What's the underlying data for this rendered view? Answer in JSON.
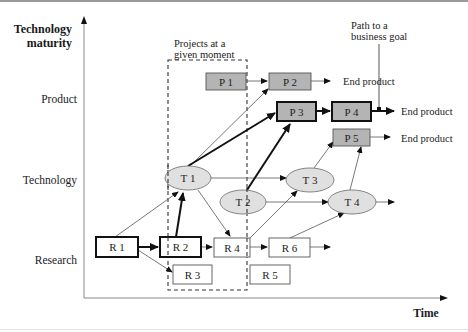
{
  "axes": {
    "y_title_line1": "Technology",
    "y_title_line2": "maturity",
    "x_title": "Time",
    "levels": [
      {
        "label": "Product"
      },
      {
        "label": "Technology"
      },
      {
        "label": "Research"
      }
    ]
  },
  "annotations": {
    "window_line1": "Projects at a",
    "window_line2": "given moment",
    "goal_line1": "Path to a",
    "goal_line2": "business goal"
  },
  "products": [
    {
      "id": "P1",
      "label": "P 1",
      "highlighted": false
    },
    {
      "id": "P2",
      "label": "P 2",
      "highlighted": false
    },
    {
      "id": "P3",
      "label": "P 3",
      "highlighted": true
    },
    {
      "id": "P4",
      "label": "P 4",
      "highlighted": true
    },
    {
      "id": "P5",
      "label": "P 5",
      "highlighted": false
    }
  ],
  "technologies": [
    {
      "id": "T1",
      "label": "T 1"
    },
    {
      "id": "T2",
      "label": "T 2"
    },
    {
      "id": "T3",
      "label": "T 3"
    },
    {
      "id": "T4",
      "label": "T 4"
    }
  ],
  "research": [
    {
      "id": "R1",
      "label": "R 1",
      "highlighted": true
    },
    {
      "id": "R2",
      "label": "R 2",
      "highlighted": true
    },
    {
      "id": "R3",
      "label": "R 3",
      "highlighted": false
    },
    {
      "id": "R4",
      "label": "R 4",
      "highlighted": false
    },
    {
      "id": "R5",
      "label": "R 5",
      "highlighted": false
    },
    {
      "id": "R6",
      "label": "R 6",
      "highlighted": false
    }
  ],
  "end_products": [
    {
      "label": "End product"
    },
    {
      "label": "End product"
    },
    {
      "label": "End product"
    }
  ],
  "colors": {
    "product_fill": "#b4b4b4",
    "tech_fill": "#e0e0e0",
    "line": "#111111",
    "thin_line": "#555555",
    "axis": "#8a8a8a"
  }
}
